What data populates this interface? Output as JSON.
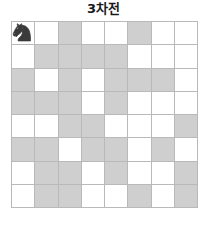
{
  "title": "3차전",
  "colors": {
    "shaded_cell": "#cfcfcf",
    "empty_cell": "#ffffff",
    "grid_line": "#b9b9b9",
    "piece": "#3a3a3a",
    "title_text": "#1a1a1a",
    "background": "#ffffff"
  },
  "board": {
    "rows": 8,
    "columns": 8,
    "cells": [
      [
        {
          "shaded": false,
          "piece": "knight"
        },
        {
          "shaded": false,
          "piece": null
        },
        {
          "shaded": true,
          "piece": null
        },
        {
          "shaded": false,
          "piece": null
        },
        {
          "shaded": false,
          "piece": null
        },
        {
          "shaded": true,
          "piece": null
        },
        {
          "shaded": false,
          "piece": null
        },
        {
          "shaded": false,
          "piece": null
        }
      ],
      [
        {
          "shaded": false,
          "piece": null
        },
        {
          "shaded": true,
          "piece": null
        },
        {
          "shaded": true,
          "piece": null
        },
        {
          "shaded": true,
          "piece": null
        },
        {
          "shaded": true,
          "piece": null
        },
        {
          "shaded": false,
          "piece": null
        },
        {
          "shaded": false,
          "piece": null
        },
        {
          "shaded": false,
          "piece": null
        }
      ],
      [
        {
          "shaded": true,
          "piece": null
        },
        {
          "shaded": false,
          "piece": null
        },
        {
          "shaded": true,
          "piece": null
        },
        {
          "shaded": false,
          "piece": null
        },
        {
          "shaded": true,
          "piece": null
        },
        {
          "shaded": true,
          "piece": null
        },
        {
          "shaded": true,
          "piece": null
        },
        {
          "shaded": false,
          "piece": null
        }
      ],
      [
        {
          "shaded": true,
          "piece": null
        },
        {
          "shaded": true,
          "piece": null
        },
        {
          "shaded": true,
          "piece": null
        },
        {
          "shaded": false,
          "piece": null
        },
        {
          "shaded": true,
          "piece": null
        },
        {
          "shaded": false,
          "piece": null
        },
        {
          "shaded": false,
          "piece": null
        },
        {
          "shaded": false,
          "piece": null
        }
      ],
      [
        {
          "shaded": false,
          "piece": null
        },
        {
          "shaded": false,
          "piece": null
        },
        {
          "shaded": true,
          "piece": null
        },
        {
          "shaded": true,
          "piece": null
        },
        {
          "shaded": false,
          "piece": null
        },
        {
          "shaded": false,
          "piece": null
        },
        {
          "shaded": false,
          "piece": null
        },
        {
          "shaded": true,
          "piece": null
        }
      ],
      [
        {
          "shaded": true,
          "piece": null
        },
        {
          "shaded": true,
          "piece": null
        },
        {
          "shaded": false,
          "piece": null
        },
        {
          "shaded": true,
          "piece": null
        },
        {
          "shaded": true,
          "piece": null
        },
        {
          "shaded": false,
          "piece": null
        },
        {
          "shaded": true,
          "piece": null
        },
        {
          "shaded": false,
          "piece": null
        }
      ],
      [
        {
          "shaded": false,
          "piece": null
        },
        {
          "shaded": true,
          "piece": null
        },
        {
          "shaded": true,
          "piece": null
        },
        {
          "shaded": false,
          "piece": null
        },
        {
          "shaded": true,
          "piece": null
        },
        {
          "shaded": false,
          "piece": null
        },
        {
          "shaded": false,
          "piece": null
        },
        {
          "shaded": true,
          "piece": null
        }
      ],
      [
        {
          "shaded": false,
          "piece": null
        },
        {
          "shaded": true,
          "piece": null
        },
        {
          "shaded": true,
          "piece": null
        },
        {
          "shaded": false,
          "piece": null
        },
        {
          "shaded": false,
          "piece": null
        },
        {
          "shaded": true,
          "piece": null
        },
        {
          "shaded": false,
          "piece": null
        },
        {
          "shaded": true,
          "piece": null
        }
      ]
    ]
  }
}
